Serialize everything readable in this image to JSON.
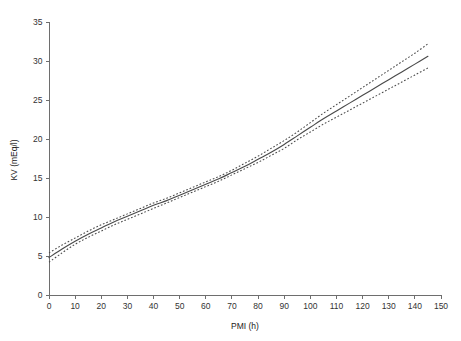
{
  "chart_data": {
    "type": "line",
    "title": "",
    "xlabel": "PMI (h)",
    "ylabel": "KV (mEq/l)",
    "xlim": [
      0,
      150
    ],
    "ylim": [
      0,
      35
    ],
    "xticks": [
      0,
      10,
      20,
      30,
      40,
      50,
      60,
      70,
      80,
      90,
      100,
      110,
      120,
      130,
      140,
      150
    ],
    "yticks": [
      0,
      5,
      10,
      15,
      20,
      25,
      30,
      35
    ],
    "xtick_labels": [
      "0",
      "10",
      "20",
      "30",
      "40",
      "50",
      "60",
      "70",
      "80",
      "90",
      "100",
      "110",
      "120",
      "130",
      "140",
      "150"
    ],
    "ytick_labels": [
      "0",
      "5",
      "10",
      "15",
      "20",
      "25",
      "30",
      "35"
    ],
    "grid": false,
    "legend": false,
    "legend_position": "none",
    "line_color": "#4a4a4a",
    "ci_color": "#4a4a4a",
    "x": [
      0,
      5,
      10,
      15,
      20,
      25,
      30,
      35,
      40,
      45,
      50,
      55,
      60,
      65,
      70,
      75,
      80,
      85,
      90,
      95,
      100,
      105,
      110,
      115,
      120,
      125,
      130,
      135,
      140,
      145
    ],
    "series": [
      {
        "name": "Fitted KV",
        "style": "solid",
        "values": [
          4.8,
          5.9,
          6.9,
          7.8,
          8.6,
          9.4,
          10.1,
          10.8,
          11.5,
          12.1,
          12.8,
          13.5,
          14.2,
          14.9,
          15.7,
          16.5,
          17.4,
          18.3,
          19.3,
          20.4,
          21.5,
          22.6,
          23.6,
          24.6,
          25.6,
          26.6,
          27.6,
          28.6,
          29.6,
          30.6
        ]
      },
      {
        "name": "Upper 95% confidence limit",
        "style": "dotted",
        "values": [
          5.4,
          6.4,
          7.3,
          8.2,
          9.0,
          9.7,
          10.4,
          11.1,
          11.8,
          12.4,
          13.1,
          13.8,
          14.5,
          15.2,
          16.0,
          16.9,
          17.8,
          18.8,
          19.8,
          20.9,
          22.1,
          23.3,
          24.4,
          25.5,
          26.6,
          27.7,
          28.8,
          29.9,
          31.0,
          32.2
        ]
      },
      {
        "name": "Lower 95% confidence limit",
        "style": "dotted",
        "values": [
          4.2,
          5.4,
          6.5,
          7.4,
          8.2,
          9.0,
          9.7,
          10.4,
          11.1,
          11.8,
          12.5,
          13.2,
          13.9,
          14.6,
          15.4,
          16.2,
          17.0,
          17.9,
          18.8,
          19.9,
          20.9,
          21.9,
          22.8,
          23.7,
          24.6,
          25.5,
          26.4,
          27.3,
          28.2,
          29.1
        ]
      }
    ]
  }
}
